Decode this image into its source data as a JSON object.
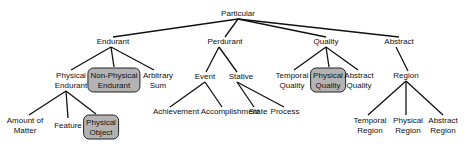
{
  "diagram": {
    "type": "taxonomy-tree",
    "root": "particular",
    "nodes": [
      {
        "id": "particular",
        "label": "Particular",
        "x": 238,
        "y": 14,
        "highlighted": false
      },
      {
        "id": "endurant",
        "label": "Endurant",
        "x": 113,
        "y": 42,
        "highlighted": false
      },
      {
        "id": "perdurant",
        "label": "Perdurant",
        "x": 225,
        "y": 42,
        "highlighted": false
      },
      {
        "id": "quality",
        "label": "Quality",
        "x": 326,
        "y": 42,
        "highlighted": false
      },
      {
        "id": "abstract",
        "label": "Abstract",
        "x": 399,
        "y": 42,
        "highlighted": false
      },
      {
        "id": "physical-endurant",
        "label": "Physical\nEndurant",
        "x": 71,
        "y": 80,
        "highlighted": false
      },
      {
        "id": "non-physical-endurant",
        "label": "Non-Physical\nEndurant",
        "x": 114,
        "y": 80,
        "highlighted": true
      },
      {
        "id": "arbitrary-sum",
        "label": "Arbitrary\nSum",
        "x": 158,
        "y": 80,
        "highlighted": false
      },
      {
        "id": "event",
        "label": "Event",
        "x": 205,
        "y": 77,
        "highlighted": false
      },
      {
        "id": "stative",
        "label": "Stative",
        "x": 241,
        "y": 77,
        "highlighted": false
      },
      {
        "id": "temporal-quality",
        "label": "Temporal\nQuality",
        "x": 292,
        "y": 80,
        "highlighted": false
      },
      {
        "id": "physical-quality",
        "label": "Physical\nQuality",
        "x": 328,
        "y": 80,
        "highlighted": true
      },
      {
        "id": "abstract-quality",
        "label": "Abstract\nQuality",
        "x": 359,
        "y": 80,
        "highlighted": false
      },
      {
        "id": "region",
        "label": "Region",
        "x": 406,
        "y": 76,
        "highlighted": false
      },
      {
        "id": "amount-of-matter",
        "label": "Amount of\nMatter",
        "x": 25,
        "y": 125,
        "highlighted": false
      },
      {
        "id": "feature",
        "label": "Feature",
        "x": 68,
        "y": 126,
        "highlighted": false
      },
      {
        "id": "physical-object",
        "label": "Physical\nObject",
        "x": 101,
        "y": 127,
        "highlighted": true
      },
      {
        "id": "achievement",
        "label": "Achievement",
        "x": 176,
        "y": 112,
        "highlighted": false
      },
      {
        "id": "accomplishment",
        "label": "Accomplishment",
        "x": 230,
        "y": 112,
        "highlighted": false
      },
      {
        "id": "state",
        "label": "State",
        "x": 258,
        "y": 112,
        "highlighted": false
      },
      {
        "id": "process",
        "label": "Process",
        "x": 285,
        "y": 112,
        "highlighted": false
      },
      {
        "id": "temporal-region",
        "label": "Temporal\nRegion",
        "x": 370,
        "y": 125,
        "highlighted": false
      },
      {
        "id": "physical-region",
        "label": "Physical\nRegion",
        "x": 408,
        "y": 125,
        "highlighted": false
      },
      {
        "id": "abstract-region",
        "label": "Abstract\nRegion",
        "x": 443,
        "y": 125,
        "highlighted": false
      }
    ],
    "edges": [
      {
        "from": "particular",
        "to": "endurant",
        "x1": 238,
        "y1": 19,
        "x2": 113,
        "y2": 37
      },
      {
        "from": "particular",
        "to": "perdurant",
        "x1": 238,
        "y1": 19,
        "x2": 225,
        "y2": 37
      },
      {
        "from": "particular",
        "to": "quality",
        "x1": 238,
        "y1": 19,
        "x2": 326,
        "y2": 37
      },
      {
        "from": "particular",
        "to": "abstract",
        "x1": 238,
        "y1": 19,
        "x2": 399,
        "y2": 37
      },
      {
        "from": "endurant",
        "to": "physical-endurant",
        "x1": 111,
        "y1": 47,
        "x2": 71,
        "y2": 70
      },
      {
        "from": "endurant",
        "to": "non-physical-endurant",
        "x1": 111,
        "y1": 47,
        "x2": 114,
        "y2": 67
      },
      {
        "from": "endurant",
        "to": "arbitrary-sum",
        "x1": 111,
        "y1": 47,
        "x2": 154,
        "y2": 70
      },
      {
        "from": "perdurant",
        "to": "event",
        "x1": 219,
        "y1": 47,
        "x2": 206,
        "y2": 72
      },
      {
        "from": "perdurant",
        "to": "stative",
        "x1": 219,
        "y1": 47,
        "x2": 237,
        "y2": 72
      },
      {
        "from": "quality",
        "to": "temporal-quality",
        "x1": 326,
        "y1": 47,
        "x2": 294,
        "y2": 70
      },
      {
        "from": "quality",
        "to": "physical-quality",
        "x1": 326,
        "y1": 47,
        "x2": 329,
        "y2": 67
      },
      {
        "from": "quality",
        "to": "abstract-quality",
        "x1": 326,
        "y1": 47,
        "x2": 358,
        "y2": 70
      },
      {
        "from": "abstract",
        "to": "region",
        "x1": 396,
        "y1": 47,
        "x2": 408,
        "y2": 71
      },
      {
        "from": "physical-endurant",
        "to": "amount-of-matter",
        "x1": 66,
        "y1": 91,
        "x2": 29,
        "y2": 115
      },
      {
        "from": "physical-endurant",
        "to": "feature",
        "x1": 66,
        "y1": 91,
        "x2": 68,
        "y2": 118
      },
      {
        "from": "physical-endurant",
        "to": "physical-object",
        "x1": 66,
        "y1": 91,
        "x2": 96,
        "y2": 114
      },
      {
        "from": "event",
        "to": "achievement",
        "x1": 205,
        "y1": 82,
        "x2": 170,
        "y2": 107
      },
      {
        "from": "event",
        "to": "accomplishment",
        "x1": 205,
        "y1": 82,
        "x2": 222,
        "y2": 107
      },
      {
        "from": "stative",
        "to": "state",
        "x1": 237,
        "y1": 82,
        "x2": 254,
        "y2": 107
      },
      {
        "from": "stative",
        "to": "process",
        "x1": 237,
        "y1": 82,
        "x2": 284,
        "y2": 107
      },
      {
        "from": "region",
        "to": "temporal-region",
        "x1": 406,
        "y1": 81,
        "x2": 368,
        "y2": 115
      },
      {
        "from": "region",
        "to": "physical-region",
        "x1": 406,
        "y1": 81,
        "x2": 406,
        "y2": 115
      },
      {
        "from": "region",
        "to": "abstract-region",
        "x1": 406,
        "y1": 81,
        "x2": 443,
        "y2": 115
      }
    ],
    "colors": {
      "background": "#ffffff",
      "edge": "#111111",
      "text": "#111111",
      "highlight_fill": "#b3b3b3",
      "highlight_border": "#222222"
    }
  }
}
